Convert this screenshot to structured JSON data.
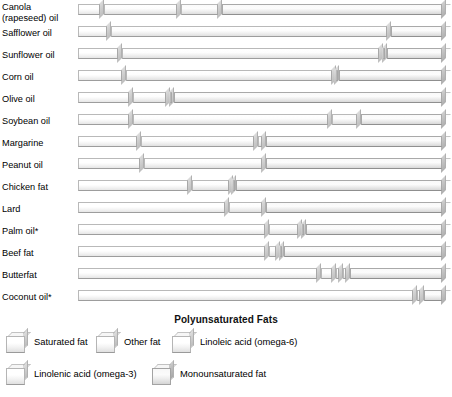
{
  "poly_title": "Polyunsaturated Fats",
  "legend": {
    "rows": [
      [
        {
          "label": "Saturated fat",
          "key": "sat",
          "x": 6
        },
        {
          "label": "Other fat",
          "key": "other",
          "x": 96
        },
        {
          "label": "Linoleic acid (omega-6)",
          "key": "lin6",
          "x": 172
        }
      ],
      [
        {
          "label": "Linolenic acid (omega-3)",
          "key": "lin3",
          "x": 6
        },
        {
          "label": "Monounsaturated fat",
          "key": "mono",
          "x": 152
        }
      ]
    ]
  },
  "chart_data": {
    "type": "bar",
    "subtitle": "",
    "xlabel": "",
    "ylabel": "",
    "orientation": "horizontal",
    "stacked": true,
    "normalized": true,
    "xlim": [
      0,
      100
    ],
    "grid": false,
    "legend_position": "bottom",
    "annotations": [
      "Polyunsaturated Fats",
      "* Palm oil and coconut oil are tropical oils"
    ],
    "series_order": [
      "Saturated fat",
      "Other fat",
      "Linoleic acid (omega-6)",
      "Linolenic acid (omega-3)",
      "Monounsaturated fat"
    ],
    "series": [
      {
        "name": "Saturated fat",
        "key": "sat",
        "values": [
          7,
          9,
          12,
          13,
          15,
          15,
          17,
          18,
          31,
          41,
          52,
          52,
          66,
          92
        ]
      },
      {
        "name": "Other fat",
        "key": "other",
        "values": [
          0,
          0,
          0,
          0,
          0,
          0,
          0,
          0,
          0,
          0,
          0,
          0,
          4,
          0
        ]
      },
      {
        "name": "Linoleic acid (omega-6)",
        "key": "lin6",
        "values": [
          21,
          76,
          71,
          57,
          10,
          54,
          32,
          33,
          11,
          10,
          9,
          3,
          2,
          2
        ]
      },
      {
        "name": "Linolenic acid (omega-3)",
        "key": "lin3",
        "values": [
          11,
          0,
          1,
          1,
          1,
          8,
          2,
          0,
          1,
          0,
          1,
          1,
          2,
          0
        ]
      },
      {
        "name": "Monounsaturated fat",
        "key": "mono",
        "values": [
          61,
          15,
          16,
          29,
          74,
          23,
          49,
          49,
          57,
          49,
          38,
          44,
          26,
          6
        ]
      }
    ],
    "categories": [
      "Canola\n(rapeseed) oil",
      "Safflower oil",
      "Sunflower oil",
      "Corn oil",
      "Olive oil",
      "Soybean oil",
      "Margarine",
      "Peanut oil",
      "Chicken fat",
      "Lard",
      "Palm oil*",
      "Beef fat",
      "Butterfat",
      "Coconut oil*"
    ]
  }
}
